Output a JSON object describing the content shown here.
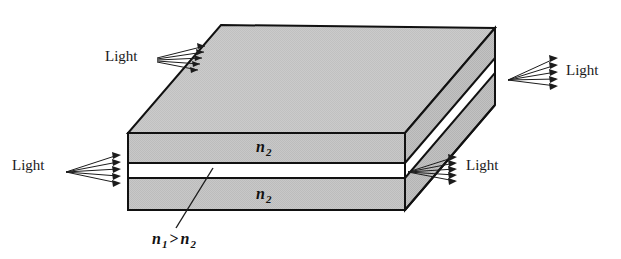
{
  "figure": {
    "type": "slab-waveguide-3d-diagram",
    "colors": {
      "face_top": "#c9c9c9",
      "face_front": "#c6c6c6",
      "face_right": "#bdbdbd",
      "core_white": "#ffffff",
      "outline": "#111111",
      "text": "#1a1a1a",
      "background": "#ffffff"
    }
  },
  "labels": {
    "light_top_left": "Light",
    "light_top_right": "Light",
    "light_mid_left": "Light",
    "light_mid_right": "Light",
    "cladding_upper": "n",
    "cladding_upper_sub": "2",
    "cladding_lower": "n",
    "cladding_lower_sub": "2",
    "index_relation_n1": "n",
    "index_relation_n1_sub": "1",
    "index_relation_operator": ">",
    "index_relation_n2": "n",
    "index_relation_n2_sub": "2"
  },
  "beams": {
    "top_left": {
      "name": "incident-beam-top-left",
      "ray_count": 5,
      "direction": "into-top-left-edge",
      "arrow_side": "right"
    },
    "top_right": {
      "name": "emergent-beam-top-right",
      "ray_count": 5,
      "direction": "out-of-right-face",
      "arrow_side": "right"
    },
    "mid_left": {
      "name": "incident-beam-mid-left",
      "ray_count": 5,
      "direction": "into-front-left-face",
      "arrow_side": "right"
    },
    "mid_right": {
      "name": "emergent-beam-mid-right",
      "ray_count": 5,
      "direction": "out-of-front-right",
      "arrow_side": "right"
    }
  },
  "geometry": {
    "top_face": "221,25 495,28 405,133 128,133",
    "front_face": "128,133 405,133 405,210 128,210",
    "right_face": "405,133 495,28 495,105 405,210",
    "core_front": "128,163 405,163 405,178 128,178",
    "core_right": "405,163 495,58 495,73 405,178",
    "divider_upper_y": 163,
    "divider_lower_y": 178,
    "leader_line": "213,168 175,230"
  }
}
